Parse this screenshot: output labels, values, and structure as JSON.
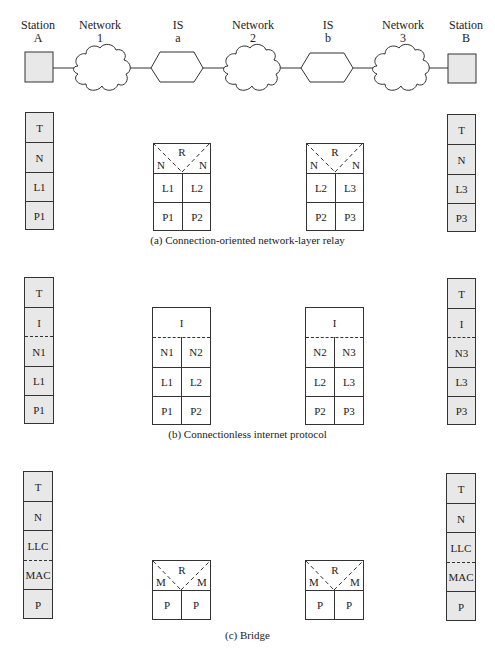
{
  "topology": {
    "nodes": [
      {
        "id": "station-a",
        "line1": "Station",
        "line2": "A",
        "type": "station"
      },
      {
        "id": "network-1",
        "line1": "Network",
        "line2": "1",
        "type": "cloud"
      },
      {
        "id": "is-a",
        "line1": "IS",
        "line2": "a",
        "type": "hexagon"
      },
      {
        "id": "network-2",
        "line1": "Network",
        "line2": "2",
        "type": "cloud"
      },
      {
        "id": "is-b",
        "line1": "IS",
        "line2": "b",
        "type": "hexagon"
      },
      {
        "id": "network-3",
        "line1": "Network",
        "line2": "3",
        "type": "cloud"
      },
      {
        "id": "station-b",
        "line1": "Station",
        "line2": "B",
        "type": "station"
      }
    ]
  },
  "panels": {
    "a": {
      "caption": "(a) Connection-oriented network-layer relay",
      "station_a": [
        "T",
        "N",
        "L1",
        "P1"
      ],
      "station_b": [
        "T",
        "N",
        "L3",
        "P3"
      ],
      "is_a": {
        "relay": "R",
        "left_top": "N",
        "right_top": "N",
        "rows": [
          [
            "L1",
            "L2"
          ],
          [
            "P1",
            "P2"
          ]
        ]
      },
      "is_b": {
        "relay": "R",
        "left_top": "N",
        "right_top": "N",
        "rows": [
          [
            "L2",
            "L3"
          ],
          [
            "P2",
            "P3"
          ]
        ]
      }
    },
    "b": {
      "caption": "(b) Connectionless internet protocol",
      "station_a": [
        "T",
        "I",
        "N1",
        "L1",
        "P1"
      ],
      "station_b": [
        "T",
        "I",
        "N3",
        "L3",
        "P3"
      ],
      "is_a": {
        "top": "I",
        "rows": [
          [
            "N1",
            "N2"
          ],
          [
            "L1",
            "L2"
          ],
          [
            "P1",
            "P2"
          ]
        ]
      },
      "is_b": {
        "top": "I",
        "rows": [
          [
            "N2",
            "N3"
          ],
          [
            "L2",
            "L3"
          ],
          [
            "P2",
            "P3"
          ]
        ]
      }
    },
    "c": {
      "caption": "(c) Bridge",
      "station_a": [
        "T",
        "N",
        "LLC",
        "MAC",
        "P"
      ],
      "station_b": [
        "T",
        "N",
        "LLC",
        "MAC",
        "P"
      ],
      "is_a": {
        "relay": "R",
        "left_top": "M",
        "right_top": "M",
        "rows": [
          [
            "P",
            "P"
          ]
        ]
      },
      "is_b": {
        "relay": "R",
        "left_top": "M",
        "right_top": "M",
        "rows": [
          [
            "P",
            "P"
          ]
        ]
      }
    }
  },
  "colors": {
    "station_fill": "#e8e8e8",
    "stroke": "#333333"
  }
}
